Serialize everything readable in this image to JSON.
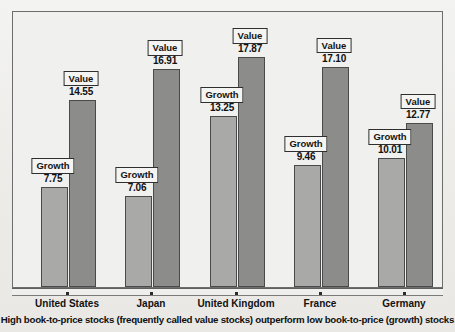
{
  "chart_data": {
    "type": "bar",
    "title": "",
    "caption": "High book-to-price stocks (frequently called value stocks) outperform low book-to-price (growth) stocks",
    "categories": [
      "United States",
      "Japan",
      "United Kingdom",
      "France",
      "Germany"
    ],
    "series": [
      {
        "name": "Growth",
        "label": "Growth",
        "color": "#a9a9a7",
        "values": [
          7.75,
          7.06,
          13.25,
          9.46,
          10.01
        ],
        "value_labels": [
          "7.75",
          "7.06",
          "13.25",
          "9.46",
          "10.01"
        ]
      },
      {
        "name": "Value",
        "label": "Value",
        "color": "#8c8c8a",
        "values": [
          14.55,
          16.91,
          17.87,
          17.1,
          12.77
        ],
        "value_labels": [
          "14.55",
          "16.91",
          "17.87",
          "17.10",
          "12.77"
        ]
      }
    ],
    "xlabel": "",
    "ylabel": "",
    "ylim": [
      0,
      20
    ],
    "grid": false,
    "legend": "inline-box-labels-above-bars",
    "axis_visible": {
      "x": true,
      "y": false
    },
    "tick_labels_y": []
  },
  "frame": {
    "border_color": "#6d6d6d",
    "background": "#f0f0ee"
  }
}
